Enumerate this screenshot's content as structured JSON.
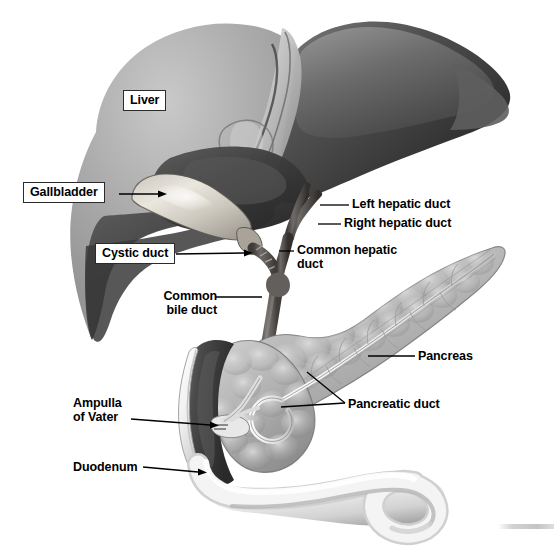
{
  "figure": {
    "style": "grayscale medical illustration",
    "width": 554,
    "height": 547,
    "background_color": "#ffffff"
  },
  "labels": [
    {
      "id": "liver",
      "text": "Liver",
      "boxed": true,
      "x": 123,
      "y": 90,
      "align": "left"
    },
    {
      "id": "gallbladder",
      "text": "Gallbladder",
      "boxed": true,
      "x": 23,
      "y": 182,
      "align": "left"
    },
    {
      "id": "cystic-duct",
      "text": "Cystic duct",
      "boxed": true,
      "x": 95,
      "y": 243,
      "align": "left"
    },
    {
      "id": "left-hepatic-duct",
      "text": "Left hepatic duct",
      "boxed": false,
      "x": 352,
      "y": 197,
      "align": "left"
    },
    {
      "id": "right-hepatic-duct",
      "text": "Right hepatic duct",
      "boxed": false,
      "x": 344,
      "y": 216,
      "align": "left"
    },
    {
      "id": "common-hepatic-duct",
      "text": "Common hepatic\nduct",
      "boxed": false,
      "x": 297,
      "y": 243,
      "align": "left"
    },
    {
      "id": "common-bile-duct",
      "text": "Common\nbile duct",
      "boxed": false,
      "x": 155,
      "y": 289,
      "align": "left"
    },
    {
      "id": "pancreas",
      "text": "Pancreas",
      "boxed": false,
      "x": 418,
      "y": 349,
      "align": "left"
    },
    {
      "id": "pancreatic-duct",
      "text": "Pancreatic duct",
      "boxed": false,
      "x": 348,
      "y": 397,
      "align": "left"
    },
    {
      "id": "ampulla-of-vater",
      "text": "Ampulla\nof Vater",
      "boxed": false,
      "x": 73,
      "y": 396,
      "align": "left"
    },
    {
      "id": "duodenum",
      "text": "Duodenum",
      "boxed": false,
      "x": 73,
      "y": 460,
      "align": "left"
    }
  ],
  "leader_lines": [
    {
      "id": "gallbladder-leader",
      "from": [
        119,
        194
      ],
      "to": [
        162,
        194
      ],
      "arrow": true
    },
    {
      "id": "cystic-duct-leader",
      "from": [
        176,
        255
      ],
      "to": [
        250,
        253
      ],
      "arrow": true
    },
    {
      "id": "left-hepatic-duct-leader",
      "from": [
        320,
        205
      ],
      "to": [
        349,
        205
      ],
      "arrow": false
    },
    {
      "id": "right-hepatic-duct-leader",
      "from": [
        320,
        224
      ],
      "to": [
        341,
        224
      ],
      "arrow": false
    },
    {
      "id": "common-hepatic-duct-leader",
      "from": [
        279,
        251
      ],
      "to": [
        294,
        251
      ],
      "arrow": false
    },
    {
      "id": "common-bile-duct-leader",
      "from": [
        216,
        297
      ],
      "to": [
        259,
        297
      ],
      "arrow": false
    },
    {
      "id": "pancreas-leader",
      "from": [
        370,
        356
      ],
      "to": [
        415,
        356
      ],
      "arrow": false
    },
    {
      "id": "pancreatic-duct-leader-a",
      "from": [
        307,
        373
      ],
      "to": [
        345,
        404
      ],
      "arrow": false
    },
    {
      "id": "pancreatic-duct-leader-b",
      "from": [
        280,
        405
      ],
      "to": [
        345,
        404
      ],
      "arrow": false
    },
    {
      "id": "ampulla-leader",
      "from": [
        131,
        419
      ],
      "to": [
        218,
        425
      ],
      "arrow": true
    },
    {
      "id": "duodenum-leader",
      "from": [
        143,
        467
      ],
      "to": [
        205,
        473
      ],
      "arrow": true
    }
  ],
  "anatomy_parts": [
    {
      "id": "liver-right-lobe",
      "name": "Liver right lobe",
      "tone": "#a6a6a6"
    },
    {
      "id": "liver-left-lobe",
      "name": "Liver left lobe",
      "tone": "#3c3c3c"
    },
    {
      "id": "falciform-ligament",
      "name": "Falciform ligament",
      "tone": "#cfcfcf"
    },
    {
      "id": "gallbladder-body",
      "name": "Gallbladder",
      "tone": "#d8d4cb"
    },
    {
      "id": "cystic-duct-tube",
      "name": "Cystic duct",
      "tone": "#6e6a66"
    },
    {
      "id": "left-hepatic-duct-tube",
      "name": "Left hepatic duct",
      "tone": "#6b6764"
    },
    {
      "id": "right-hepatic-duct-tube",
      "name": "Right hepatic duct",
      "tone": "#6b6764"
    },
    {
      "id": "common-hepatic-duct-tube",
      "name": "Common hepatic duct",
      "tone": "#706c68"
    },
    {
      "id": "common-bile-duct-tube",
      "name": "Common bile duct",
      "tone": "#6a6663"
    },
    {
      "id": "pancreas-body",
      "name": "Pancreas",
      "tone": "#b6b6b6"
    },
    {
      "id": "pancreatic-duct-tube",
      "name": "Pancreatic duct",
      "tone": "#efefef"
    },
    {
      "id": "duodenum-tube",
      "name": "Duodenum",
      "tone": "#ededed"
    },
    {
      "id": "duodenum-lumen",
      "name": "Duodenum interior lumen",
      "tone": "#4a4a4a"
    },
    {
      "id": "ampulla-of-vater-structure",
      "name": "Ampulla of Vater",
      "tone": "#e6e6e6"
    }
  ]
}
